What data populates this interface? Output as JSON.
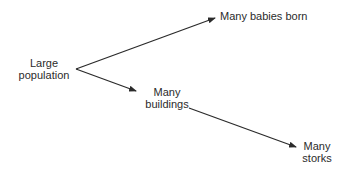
{
  "diagram": {
    "type": "causal-diagram",
    "nodes": [
      {
        "id": "large-population",
        "label_line1": "Large",
        "label_line2": "population"
      },
      {
        "id": "many-babies-born",
        "label_line1": "Many babies born"
      },
      {
        "id": "many-buildings",
        "label_line1": "Many",
        "label_line2": "buildings"
      },
      {
        "id": "many-storks",
        "label_line1": "Many",
        "label_line2": "storks"
      }
    ],
    "edges": [
      {
        "from": "large-population",
        "to": "many-babies-born"
      },
      {
        "from": "large-population",
        "to": "many-buildings"
      },
      {
        "from": "many-buildings",
        "to": "many-storks"
      }
    ],
    "colors": {
      "line": "#2b2b2b",
      "text": "#2b2b2b",
      "background": "#ffffff"
    }
  }
}
